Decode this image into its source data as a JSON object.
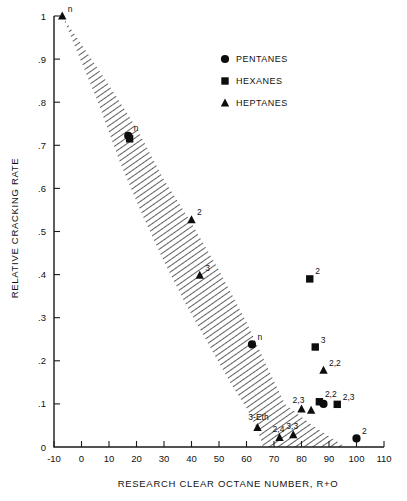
{
  "chart_data": {
    "type": "scatter",
    "title": "",
    "xlabel": "RESEARCH CLEAR OCTANE NUMBER, R+O",
    "ylabel": "RELATIVE CRACKING RATE",
    "xlim": [
      -10,
      110
    ],
    "ylim": [
      0,
      1
    ],
    "xticks": [
      -10,
      0,
      10,
      20,
      30,
      40,
      50,
      60,
      70,
      80,
      90,
      100,
      110
    ],
    "xticklabels": [
      "-10",
      "0",
      "10",
      "20",
      "30",
      "40",
      "50",
      "60",
      "70",
      "80",
      "90",
      "100",
      "110"
    ],
    "yticks": [
      0,
      0.1,
      0.2,
      0.3,
      0.4,
      0.5,
      0.6,
      0.7,
      0.8,
      0.9,
      1.0
    ],
    "yticklabels": [
      "0",
      ".1",
      ".2",
      ".3",
      ".4",
      ".5",
      ".6",
      ".7",
      ".8",
      ".9",
      "1"
    ],
    "grid": false,
    "legend_position": "upper-right",
    "legend": [
      {
        "label": "PENTANES",
        "marker": "circle"
      },
      {
        "label": "HEXANES",
        "marker": "square"
      },
      {
        "label": "HEPTANES",
        "marker": "triangle"
      }
    ],
    "annotation_band": {
      "name": "hatched-correlation-band",
      "description": "Diagonal hatched band sweeping from upper left to lower right",
      "upper_edge": [
        [
          -7,
          1.0
        ],
        [
          10,
          0.84
        ],
        [
          20,
          0.74
        ],
        [
          30,
          0.62
        ],
        [
          40,
          0.52
        ],
        [
          50,
          0.41
        ],
        [
          60,
          0.29
        ],
        [
          68,
          0.18
        ],
        [
          74,
          0.1
        ],
        [
          84,
          0.05
        ],
        [
          96,
          0.0
        ]
      ],
      "lower_edge": [
        [
          -7,
          1.0
        ],
        [
          6,
          0.8
        ],
        [
          14,
          0.66
        ],
        [
          22,
          0.54
        ],
        [
          30,
          0.43
        ],
        [
          38,
          0.33
        ],
        [
          46,
          0.24
        ],
        [
          54,
          0.15
        ],
        [
          60,
          0.09
        ],
        [
          64,
          0.04
        ],
        [
          66,
          0.0
        ]
      ]
    },
    "series": [
      {
        "name": "PENTANES",
        "marker": "circle",
        "points": [
          {
            "x": 17,
            "y": 0.722,
            "label": "n"
          },
          {
            "x": 62,
            "y": 0.238,
            "label": "n"
          },
          {
            "x": 100,
            "y": 0.02,
            "label": "2"
          },
          {
            "x": 88,
            "y": 0.1,
            "label": ""
          }
        ]
      },
      {
        "name": "HEXANES",
        "marker": "square",
        "points": [
          {
            "x": 17.5,
            "y": 0.715,
            "label": ""
          },
          {
            "x": 83,
            "y": 0.39,
            "label": "2"
          },
          {
            "x": 85,
            "y": 0.232,
            "label": "3"
          },
          {
            "x": 93,
            "y": 0.099,
            "label": "2,3"
          },
          {
            "x": 86.5,
            "y": 0.105,
            "label": "2,2"
          }
        ]
      },
      {
        "name": "HEPTANES",
        "marker": "triangle",
        "points": [
          {
            "x": -7,
            "y": 1.0,
            "label": "n"
          },
          {
            "x": 40,
            "y": 0.527,
            "label": "2"
          },
          {
            "x": 43,
            "y": 0.398,
            "label": "3"
          },
          {
            "x": 88,
            "y": 0.178,
            "label": "2,2"
          },
          {
            "x": 64,
            "y": 0.045,
            "label": "3-Eth"
          },
          {
            "x": 72,
            "y": 0.022,
            "label": "2,4"
          },
          {
            "x": 77,
            "y": 0.028,
            "label": "3,3"
          },
          {
            "x": 80,
            "y": 0.088,
            "label": "2,3"
          },
          {
            "x": 83.5,
            "y": 0.085,
            "label": ""
          }
        ]
      }
    ],
    "point_labels": [
      "n",
      "n",
      "2",
      "2",
      "3",
      "2,3",
      "2,2",
      "n",
      "2",
      "3",
      "2,2",
      "3-Eth",
      "2,4",
      "3,3",
      "2,3"
    ]
  }
}
